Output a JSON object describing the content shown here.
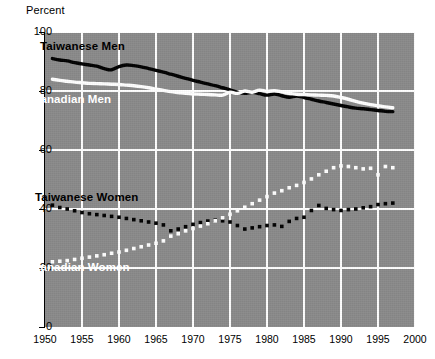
{
  "axis": {
    "y_title": "Percent",
    "y_ticks": [
      "0",
      "20",
      "40",
      "60",
      "80",
      "100"
    ],
    "x_ticks": [
      "1950",
      "1955",
      "1960",
      "1965",
      "1970",
      "1975",
      "1980",
      "1985",
      "1990",
      "1995",
      "2000"
    ]
  },
  "labels": {
    "taiwanese_men": "Taiwanese Men",
    "canadian_men": "Canadian Men",
    "taiwanese_women": "Taiwanese Women",
    "canadian_women": "Canadian Women"
  },
  "colors": {
    "plot_background": "#8a8a8a",
    "gridline": "#ffffff",
    "taiwanese": "#000000",
    "canadian": "#ffffff",
    "page_background": "#ffffff"
  },
  "chart_data": {
    "type": "line",
    "title": "",
    "subtitle": "",
    "xlabel": "",
    "ylabel": "Percent",
    "xlim": [
      1950,
      2000
    ],
    "ylim": [
      0,
      100
    ],
    "yticks": [
      0,
      20,
      40,
      60,
      80,
      100
    ],
    "xticks": [
      1950,
      1955,
      1960,
      1965,
      1970,
      1975,
      1980,
      1985,
      1990,
      1995,
      2000
    ],
    "grid": true,
    "legend": "inline-annotations",
    "series": [
      {
        "name": "Taiwanese Men",
        "style": "solid",
        "color": "#000000",
        "x": [
          1951,
          1952,
          1953,
          1954,
          1955,
          1956,
          1957,
          1958,
          1959,
          1960,
          1961,
          1962,
          1963,
          1964,
          1965,
          1966,
          1967,
          1968,
          1969,
          1970,
          1971,
          1972,
          1973,
          1974,
          1975,
          1976,
          1977,
          1978,
          1979,
          1980,
          1981,
          1982,
          1983,
          1984,
          1985,
          1986,
          1987,
          1988,
          1989,
          1990,
          1991,
          1992,
          1993,
          1994,
          1995,
          1996,
          1997
        ],
        "values": [
          91.0,
          90.5,
          90.2,
          89.6,
          89.2,
          88.8,
          88.4,
          87.6,
          87.2,
          88.3,
          88.8,
          88.6,
          88.2,
          87.6,
          87.0,
          86.4,
          85.7,
          85.0,
          84.3,
          83.6,
          83.0,
          82.4,
          81.8,
          81.1,
          80.4,
          79.6,
          79.2,
          79.6,
          79.1,
          78.6,
          79.0,
          78.4,
          77.9,
          78.3,
          77.8,
          77.2,
          76.6,
          76.1,
          75.6,
          75.1,
          74.6,
          74.2,
          74.0,
          73.7,
          73.4,
          73.1,
          73.0
        ]
      },
      {
        "name": "Canadian Men",
        "style": "solid",
        "color": "#ffffff",
        "x": [
          1951,
          1952,
          1953,
          1954,
          1955,
          1956,
          1957,
          1958,
          1959,
          1960,
          1961,
          1962,
          1963,
          1964,
          1965,
          1966,
          1967,
          1968,
          1969,
          1970,
          1971,
          1972,
          1973,
          1974,
          1975,
          1976,
          1977,
          1978,
          1979,
          1980,
          1981,
          1982,
          1983,
          1984,
          1985,
          1986,
          1987,
          1988,
          1989,
          1990,
          1991,
          1992,
          1993,
          1994,
          1995,
          1996,
          1997
        ],
        "values": [
          84.0,
          83.6,
          83.3,
          83.0,
          82.8,
          82.6,
          82.5,
          82.4,
          82.3,
          82.2,
          82.0,
          81.8,
          81.5,
          81.1,
          80.6,
          80.2,
          79.8,
          79.5,
          79.2,
          79.0,
          78.9,
          78.8,
          78.7,
          78.6,
          79.6,
          79.2,
          80.0,
          79.6,
          80.3,
          79.9,
          80.1,
          79.7,
          79.2,
          78.9,
          78.8,
          78.7,
          78.6,
          78.5,
          78.3,
          77.8,
          77.2,
          76.5,
          75.9,
          75.4,
          75.0,
          74.6,
          74.3
        ]
      },
      {
        "name": "Taiwanese Women",
        "style": "dotted",
        "color": "#000000",
        "x": [
          1951,
          1952,
          1953,
          1954,
          1955,
          1956,
          1957,
          1958,
          1959,
          1960,
          1961,
          1962,
          1963,
          1964,
          1965,
          1966,
          1967,
          1968,
          1969,
          1970,
          1971,
          1972,
          1973,
          1974,
          1975,
          1976,
          1977,
          1978,
          1979,
          1980,
          1981,
          1982,
          1983,
          1984,
          1985,
          1986,
          1987,
          1988,
          1989,
          1990,
          1991,
          1992,
          1993,
          1994,
          1995,
          1996,
          1997
        ],
        "values": [
          41.3,
          40.5,
          40.0,
          39.4,
          38.8,
          38.4,
          38.1,
          37.8,
          37.5,
          37.2,
          36.8,
          36.4,
          36.0,
          35.6,
          35.2,
          34.6,
          32.6,
          33.2,
          34.0,
          34.8,
          35.4,
          35.9,
          36.2,
          36.0,
          35.6,
          34.4,
          33.2,
          33.6,
          34.0,
          34.4,
          34.6,
          34.1,
          35.8,
          36.8,
          37.2,
          39.5,
          41.2,
          40.2,
          39.8,
          39.5,
          39.8,
          40.0,
          40.4,
          40.8,
          41.5,
          41.8,
          42.0
        ]
      },
      {
        "name": "Canadian Women",
        "style": "dotted",
        "color": "#ffffff",
        "x": [
          1951,
          1952,
          1953,
          1954,
          1955,
          1956,
          1957,
          1958,
          1959,
          1960,
          1961,
          1962,
          1963,
          1964,
          1965,
          1966,
          1967,
          1968,
          1969,
          1970,
          1971,
          1972,
          1973,
          1974,
          1975,
          1976,
          1977,
          1978,
          1979,
          1980,
          1981,
          1982,
          1983,
          1984,
          1985,
          1986,
          1987,
          1988,
          1989,
          1990,
          1991,
          1992,
          1993,
          1994,
          1995,
          1996,
          1997
        ],
        "values": [
          22.1,
          22.3,
          22.5,
          22.9,
          23.3,
          23.7,
          24.1,
          24.5,
          25.0,
          25.4,
          26.0,
          26.6,
          27.2,
          27.8,
          28.4,
          29.2,
          30.8,
          31.6,
          32.6,
          33.4,
          34.2,
          35.0,
          36.0,
          37.0,
          38.2,
          39.4,
          40.6,
          41.8,
          43.0,
          44.2,
          45.4,
          46.2,
          47.2,
          48.0,
          49.0,
          50.2,
          51.6,
          52.8,
          54.0,
          54.6,
          54.4,
          54.0,
          53.6,
          53.8,
          51.6,
          54.4,
          54.0
        ]
      }
    ]
  }
}
